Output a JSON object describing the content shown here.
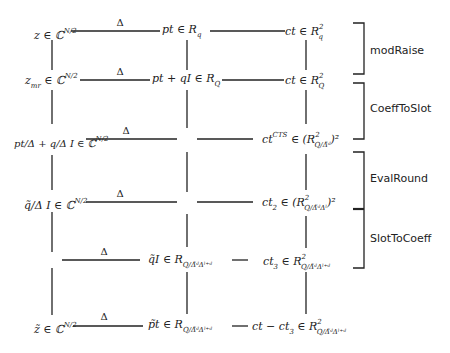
{
  "diagram": {
    "edge_label": "Δ",
    "rows": [
      {
        "id": "row1",
        "slot": {
          "base": "z ∈ ℂ",
          "sup": "N/2"
        },
        "plaintext": {
          "base": "pt ∈ R",
          "sub": "q"
        },
        "ciphertext": {
          "base": "ct ∈ R",
          "sup": "2",
          "sub": "q"
        }
      },
      {
        "id": "row2",
        "slot": {
          "base": "z",
          "sub": "mr",
          "rest": " ∈ ℂ",
          "sup": "N/2"
        },
        "plaintext": {
          "base": "pt + qI ∈ R",
          "sub": "Q"
        },
        "ciphertext": {
          "base": "ct ∈ R",
          "sup": "2",
          "sub": "Q"
        }
      },
      {
        "id": "row3",
        "slot": {
          "base": "pt/Δ + q/Δ I ∈ ℂ",
          "sup": "N/2"
        },
        "plaintext": null,
        "ciphertext": {
          "base": "ct",
          "sup": "CTS",
          "rest": " ∈ (R",
          "sup2": "2",
          "sub": "Q/Δ̃ᵈ",
          "close": ")²"
        }
      },
      {
        "id": "row4",
        "slot": {
          "base": "q̃/Δ I ∈ ℂ",
          "sup": "N/2"
        },
        "plaintext": null,
        "ciphertext": {
          "base": "ct",
          "sub": "2",
          "rest": " ∈ (R",
          "sup2": "2",
          "sub2": "Q/Δ̃ᵈΔˡ",
          "close": ")²"
        }
      },
      {
        "id": "row5",
        "slot": null,
        "plaintext": {
          "base": "q̃I ∈ R",
          "sub": "Q/Δ̃ᵈΔˡ⁺ᵈ"
        },
        "ciphertext": {
          "base": "ct",
          "sub": "3",
          "rest": " ∈ R",
          "sup": "2",
          "sub2": "Q/Δ̃ᵈΔˡ⁺ᵈ"
        }
      },
      {
        "id": "row6",
        "slot": {
          "base": "z̃ ∈ ℂ",
          "sup": "N/2"
        },
        "plaintext": {
          "base": "p̃t ∈ R",
          "sub": "Q/Δ̃ᵈΔˡ⁺ᵈ"
        },
        "ciphertext": {
          "base": "ct − ct",
          "sub": "3",
          "rest": " ∈ R",
          "sup": "2",
          "sub2": "Q/Δ̃ᵈΔˡ⁺ᵈ"
        }
      }
    ],
    "stages": [
      {
        "label": "modRaise",
        "from_row": 1,
        "to_row": 2
      },
      {
        "label": "CoeffToSlot",
        "from_row": 2,
        "to_row": 3
      },
      {
        "label": "EvalRound",
        "from_row": 3,
        "to_row": 4
      },
      {
        "label": "SlotToCoeff",
        "from_row": 4,
        "to_row": 5
      }
    ],
    "colors": {
      "line": "#222222",
      "text": "#222222",
      "background": "#ffffff"
    }
  }
}
